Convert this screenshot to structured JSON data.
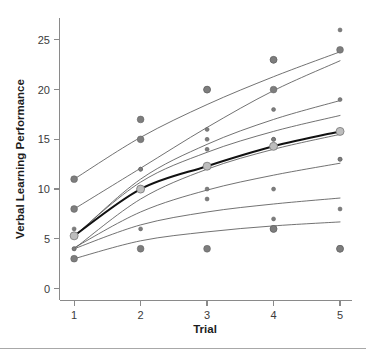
{
  "chart_data": {
    "type": "line",
    "title": "",
    "subtitle": "",
    "xlabel": "Trial",
    "ylabel": "Verbal Learning Performance",
    "x": [
      1,
      2,
      3,
      4,
      5
    ],
    "xticklabels": [
      "1",
      "2",
      "3",
      "4",
      "5"
    ],
    "yticks": [
      0,
      5,
      10,
      15,
      20,
      25
    ],
    "yticklabels": [
      "0",
      "5",
      "10",
      "15",
      "20",
      "25"
    ],
    "xlim": [
      0.78,
      5.18
    ],
    "ylim": [
      -1.2,
      27.2
    ],
    "grid": false,
    "legend": false,
    "legend_position": "none",
    "series": [
      {
        "name": "subject-1",
        "role": "individual",
        "marker_size": "large",
        "values": [
          11,
          17,
          20,
          23,
          24
        ],
        "fit_values": [
          11.0,
          15.2,
          18.5,
          21.3,
          23.8
        ]
      },
      {
        "name": "subject-2",
        "role": "individual",
        "marker_size": "large",
        "values": [
          8,
          15,
          null,
          20,
          null
        ],
        "fit_values": [
          8.0,
          12.1,
          16.2,
          19.9,
          22.9
        ]
      },
      {
        "name": "subject-3",
        "role": "individual",
        "marker_size": "small",
        "values": [
          6,
          12,
          16,
          18,
          19
        ],
        "fit_values": [
          5.2,
          11.0,
          14.5,
          17.0,
          18.9
        ]
      },
      {
        "name": "subject-4",
        "role": "individual",
        "marker_size": "small",
        "values": [
          null,
          12,
          15,
          15,
          null
        ],
        "fit_values": [
          5.3,
          10.7,
          13.7,
          15.8,
          17.4
        ]
      },
      {
        "name": "subject-5",
        "role": "individual",
        "marker_size": "small",
        "values": [
          4,
          10,
          14,
          15,
          13
        ],
        "fit_values": [
          4.0,
          9.0,
          12.0,
          14.0,
          15.5
        ]
      },
      {
        "name": "subject-6",
        "role": "individual",
        "marker_size": "small",
        "values": [
          null,
          6,
          10,
          10,
          13
        ],
        "fit_values": [
          4.1,
          7.7,
          9.9,
          11.4,
          12.6
        ]
      },
      {
        "name": "subject-7",
        "role": "individual",
        "marker_size": "small",
        "values": [
          null,
          null,
          9,
          7,
          8
        ],
        "fit_values": [
          4.0,
          6.4,
          7.7,
          8.5,
          9.1
        ]
      },
      {
        "name": "subject-8",
        "role": "individual",
        "marker_size": "large",
        "values": [
          3,
          4,
          4,
          6,
          4
        ],
        "fit_values": [
          3.0,
          4.8,
          5.7,
          6.3,
          6.7
        ]
      },
      {
        "name": "average",
        "role": "mean",
        "marker_size": "mean",
        "values": [
          5.3,
          10.0,
          12.3,
          14.3,
          15.8
        ],
        "fit_values": [
          5.3,
          10.0,
          12.3,
          14.3,
          15.8
        ]
      }
    ],
    "extra_points": [
      {
        "x": 2,
        "y": 10,
        "size": "large"
      },
      {
        "x": 3,
        "y": 20,
        "size": "large"
      },
      {
        "x": 4,
        "y": 23,
        "size": "large"
      },
      {
        "x": 5,
        "y": 26,
        "size": "small"
      },
      {
        "x": 1,
        "y": 4,
        "size": "small"
      },
      {
        "x": 4,
        "y": 6,
        "size": "large"
      },
      {
        "x": 5,
        "y": 4,
        "size": "large"
      }
    ]
  },
  "axes": {
    "x_title": "Trial",
    "y_title": "Verbal Learning Performance"
  }
}
